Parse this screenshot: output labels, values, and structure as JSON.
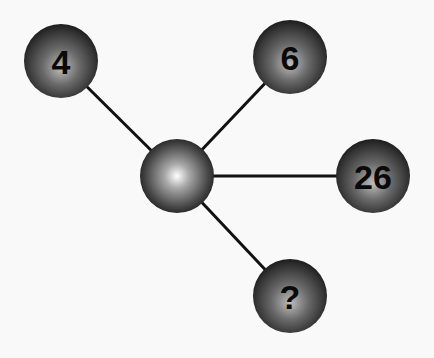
{
  "diagram": {
    "type": "number-puzzle-hub",
    "center_node": {
      "label": "",
      "x": 177,
      "y": 176,
      "r": 37
    },
    "outer_nodes": [
      {
        "label": "4",
        "x": 61,
        "y": 61,
        "r": 37
      },
      {
        "label": "6",
        "x": 290,
        "y": 57,
        "r": 37
      },
      {
        "label": "26",
        "x": 373,
        "y": 176,
        "r": 37
      },
      {
        "label": "?",
        "x": 290,
        "y": 296,
        "r": 37
      }
    ],
    "colors": {
      "background": "#f9f9f9",
      "sphere_dark": "#1a1a1a",
      "sphere_mid": "#6e6e6e",
      "sphere_highlight": "#ffffff",
      "line": "#111111",
      "text": "#0a0a0a"
    }
  }
}
